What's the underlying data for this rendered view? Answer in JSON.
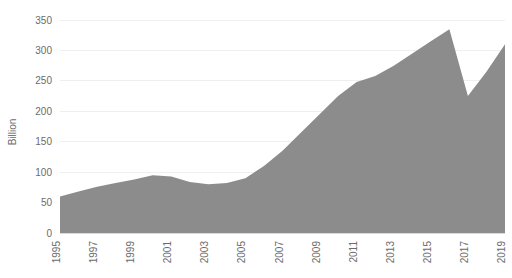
{
  "chart_data": {
    "type": "area",
    "title": "",
    "xlabel": "",
    "ylabel": "Billion",
    "ylim": [
      0,
      350
    ],
    "ytick_step": 50,
    "yticks": [
      0,
      50,
      100,
      150,
      200,
      250,
      300,
      350
    ],
    "ytick_labels": [
      "0",
      "50",
      "100",
      "150",
      "200",
      "250",
      "300",
      "350"
    ],
    "xlim": [
      1995,
      2019
    ],
    "xticks": [
      1995,
      1997,
      1999,
      2001,
      2003,
      2005,
      2007,
      2009,
      2011,
      2013,
      2015,
      2017,
      2019
    ],
    "xtick_labels": [
      "1995",
      "1997",
      "1999",
      "2001",
      "2003",
      "2005",
      "2007",
      "2009",
      "2011",
      "2013",
      "2015",
      "2017",
      "2019"
    ],
    "xtick_rotation": -90,
    "grid": "horizontal",
    "legend": "none",
    "series": [
      {
        "name": "Billion",
        "x": [
          1995,
          1996,
          1997,
          1998,
          1999,
          2000,
          2001,
          2002,
          2003,
          2004,
          2005,
          2006,
          2007,
          2008,
          2009,
          2010,
          2011,
          2012,
          2013,
          2014,
          2015,
          2016,
          2017,
          2018,
          2019
        ],
        "values": [
          60,
          68,
          76,
          82,
          88,
          95,
          93,
          84,
          80,
          82,
          90,
          110,
          135,
          165,
          195,
          225,
          248,
          258,
          275,
          295,
          315,
          335,
          225,
          265,
          310
        ]
      }
    ],
    "colors": {
      "area_fill": "#8c8c8c",
      "gridline": "#efefef",
      "axis_text": "#6b6b6b",
      "background": "#ffffff"
    }
  }
}
